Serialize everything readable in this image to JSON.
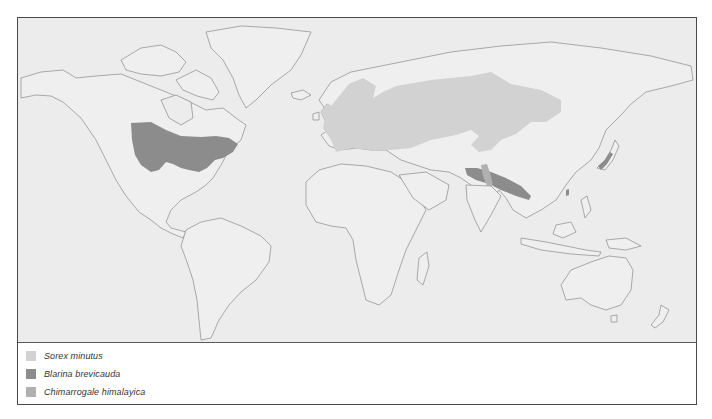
{
  "map": {
    "type": "species distribution map",
    "background_color": "#ececec",
    "land_color": "#efefef",
    "outline_color": "#8a8a8a"
  },
  "legend": {
    "items": [
      {
        "label": "Sorex minutus",
        "color": "#d2d2d2"
      },
      {
        "label": "Blarina brevicauda",
        "color": "#8c8c8c"
      },
      {
        "label": "Chimarrogale himalayica",
        "color": "#b0b0b0"
      }
    ]
  },
  "ranges": [
    {
      "species": "Sorex minutus",
      "region": "Europe to central Siberia"
    },
    {
      "species": "Blarina brevicauda",
      "region": "Eastern North America"
    },
    {
      "species": "Chimarrogale himalayica",
      "region": "Himalaya, China, Japan"
    }
  ]
}
